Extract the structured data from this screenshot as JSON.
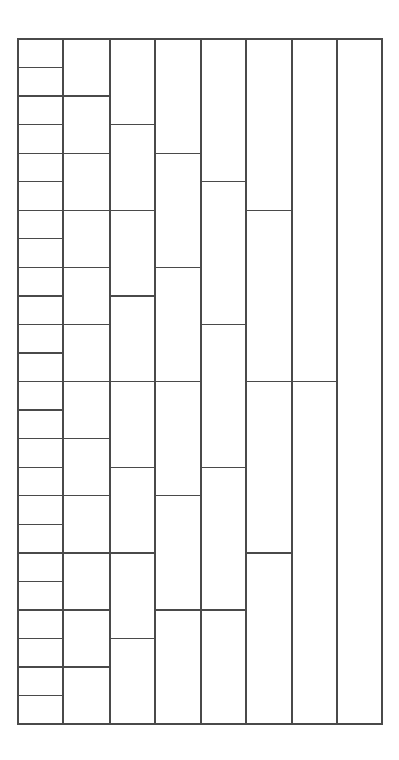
{
  "figure": {
    "title": "",
    "type": "nested-subdivision-grid",
    "background_color": "#ffffff",
    "line_color": "#4a4a4a",
    "frame": {
      "x": 18,
      "y": 39,
      "width": 364,
      "height": 685
    },
    "column_edges_x": [
      18,
      63,
      110,
      155,
      201,
      246,
      292,
      337,
      382
    ],
    "base_row_unit_px": 28.54,
    "columns": [
      {
        "index": 1,
        "name": "column-1",
        "cell_count": 24,
        "cell_height_units": 1,
        "divider_y": [
          67.5,
          96.1,
          124.6,
          153.2,
          181.7,
          210.3,
          238.8,
          267.4,
          295.9,
          324.5,
          353.0,
          381.6,
          410.1,
          438.7,
          467.2,
          495.8,
          524.3,
          552.9,
          581.4,
          610.0,
          638.5,
          667.1,
          695.6
        ]
      },
      {
        "index": 2,
        "name": "column-2",
        "cell_count": 12,
        "cell_height_units": 2,
        "divider_y": [
          96.1,
          153.2,
          210.3,
          267.4,
          324.5,
          381.6,
          438.7,
          495.8,
          552.9,
          610.0,
          667.1
        ]
      },
      {
        "index": 3,
        "name": "column-3",
        "cell_count": 8,
        "cell_height_units": 3,
        "divider_y": [
          124.6,
          210.3,
          295.9,
          381.6,
          467.2,
          552.9,
          638.5
        ]
      },
      {
        "index": 4,
        "name": "column-4",
        "cell_count": 6,
        "cell_height_units": 4,
        "divider_y": [
          153.2,
          267.4,
          381.6,
          495.8,
          610.0
        ]
      },
      {
        "index": 5,
        "name": "column-5",
        "cell_count": 5,
        "cell_height_units": 4.8,
        "divider_y": [
          181.7,
          324.5,
          467.2,
          610.0
        ]
      },
      {
        "index": 6,
        "name": "column-6",
        "cell_count": 4,
        "cell_height_units": 6,
        "divider_y": [
          210.3,
          381.6,
          552.9
        ]
      },
      {
        "index": 7,
        "name": "column-7",
        "cell_count": 2,
        "cell_height_units": 12,
        "divider_y": [
          381.6
        ]
      },
      {
        "index": 8,
        "name": "column-8",
        "cell_count": 1,
        "cell_height_units": 24,
        "divider_y": []
      }
    ]
  }
}
